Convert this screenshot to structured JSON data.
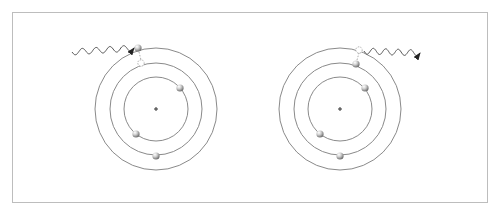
{
  "diagram": {
    "colors": {
      "frame": "#bdbdbd",
      "orbit": "#8a8a8a",
      "electron_light": "#f2f2f2",
      "electron_dark": "#7a7a7a",
      "wave": "#555555",
      "nucleus": "#333333"
    },
    "atoms": [
      {
        "name": "absorption",
        "center": [
          156,
          109
        ],
        "orbit_radii": [
          32,
          46,
          61
        ],
        "electrons": [
          {
            "x": 138,
            "y": 48,
            "orbit": 3
          },
          {
            "x": 180,
            "y": 88,
            "orbit": 1
          },
          {
            "x": 136,
            "y": 134,
            "orbit": 1
          },
          {
            "x": 156,
            "y": 156,
            "orbit": 2
          }
        ],
        "vacancy": {
          "x": 141,
          "y": 63
        },
        "photon": {
          "direction": "incoming",
          "from": [
            72,
            52
          ],
          "to": [
            134,
            48
          ]
        }
      },
      {
        "name": "emission",
        "center": [
          340,
          109
        ],
        "orbit_radii": [
          32,
          46,
          61
        ],
        "electrons": [
          {
            "x": 356,
            "y": 64,
            "orbit": 2
          },
          {
            "x": 365,
            "y": 88,
            "orbit": 1
          },
          {
            "x": 320,
            "y": 134,
            "orbit": 1
          },
          {
            "x": 340,
            "y": 156,
            "orbit": 2
          }
        ],
        "vacancy": {
          "x": 359,
          "y": 50
        },
        "photon": {
          "direction": "outgoing",
          "from": [
            364,
            51
          ],
          "to": [
            420,
            53
          ]
        }
      }
    ]
  }
}
